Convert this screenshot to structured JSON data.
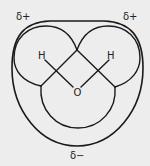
{
  "diagram": {
    "atoms": {
      "hydrogen_left": "H",
      "hydrogen_right": "H",
      "oxygen": "O"
    },
    "charges": {
      "top_left": "δ+",
      "top_right": "δ+",
      "bottom": "δ−"
    },
    "colors": {
      "background": "#ededed",
      "line": "#1a1a1a"
    }
  }
}
